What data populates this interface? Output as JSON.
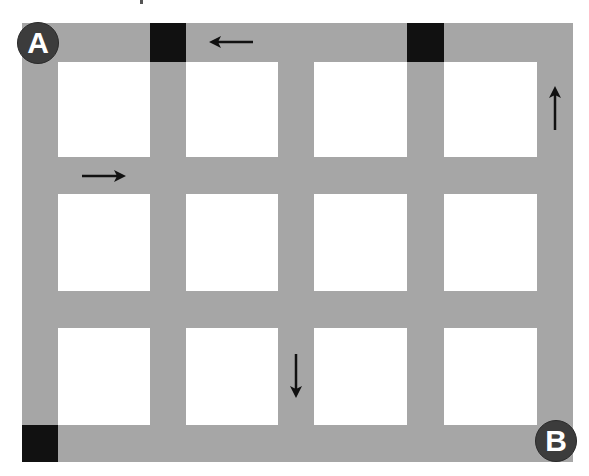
{
  "diagram": {
    "colors": {
      "road": "#a6a6a6",
      "block": "#ffffff",
      "blocked": "#111111",
      "marker": "#3c3c3c",
      "arrow": "#111111"
    },
    "markers": [
      {
        "label": "A",
        "position": "top-left"
      },
      {
        "label": "B",
        "position": "bottom-right"
      }
    ],
    "grid": {
      "columns": 4,
      "rows": 3
    },
    "blocked_segments": [
      {
        "position": "top road, between column 1 and 2"
      },
      {
        "position": "top road, between column 3 and 4"
      },
      {
        "position": "bottom-left corner"
      }
    ],
    "arrows": [
      {
        "direction": "left",
        "position": "top road, above column 2"
      },
      {
        "direction": "right",
        "position": "first horizontal inner road, below column 1"
      },
      {
        "direction": "up",
        "position": "right road, beside column 4 row 1"
      },
      {
        "direction": "down",
        "position": "vertical road between column 2 and 3, row 3"
      }
    ]
  }
}
